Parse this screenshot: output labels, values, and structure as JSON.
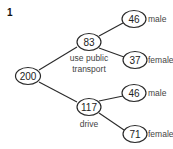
{
  "question_number": "1",
  "tree": {
    "root": {
      "value": "200"
    },
    "branches": [
      {
        "value": "83",
        "label_lines": [
          "use public",
          "transport"
        ],
        "children": [
          {
            "value": "46",
            "label": "male"
          },
          {
            "value": "37",
            "label": "female"
          }
        ]
      },
      {
        "value": "117",
        "label_lines": [
          "drive"
        ],
        "children": [
          {
            "value": "46",
            "label": "male"
          },
          {
            "value": "71",
            "label": "female"
          }
        ]
      }
    ]
  }
}
